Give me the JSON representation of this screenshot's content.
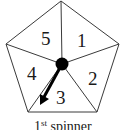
{
  "diagram": {
    "type": "spinner",
    "shape": "pentagon",
    "caption": {
      "prefix": "1",
      "superscript": "st",
      "suffix": " spinner"
    },
    "sections": [
      {
        "label": "1"
      },
      {
        "label": "2"
      },
      {
        "label": "3"
      },
      {
        "label": "4"
      },
      {
        "label": "5"
      }
    ],
    "pointer": {
      "points_to": "3"
    },
    "colors": {
      "stroke": "#3a3a3a",
      "hub": "#000000",
      "arrow": "#000000",
      "background": "#ffffff"
    }
  }
}
